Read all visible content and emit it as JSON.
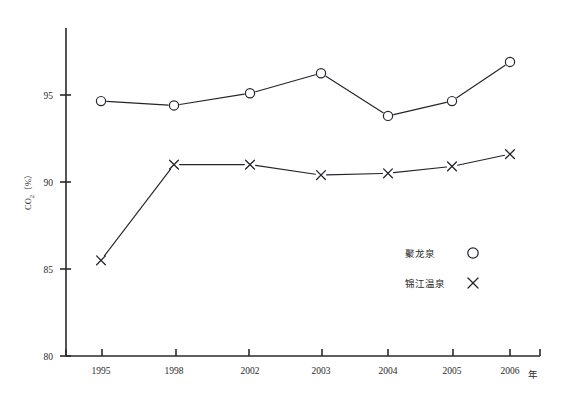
{
  "chart_data": {
    "type": "line",
    "title": "",
    "xlabel": "年",
    "ylabel": "CO₂（%）",
    "ylabel_parts": {
      "base": "CO",
      "sub": "2",
      "unit": "（%）"
    },
    "categories": [
      "1995",
      "1998",
      "2002",
      "2003",
      "2004",
      "2005",
      "2006"
    ],
    "x": [
      1995,
      1998,
      2002,
      2003,
      2004,
      2005,
      2006
    ],
    "ylim": [
      80,
      97.5
    ],
    "yticks": [
      80,
      85,
      90,
      95
    ],
    "ytick_labels": [
      "80",
      "85",
      "90",
      "95"
    ],
    "grid": false,
    "legend_position": "inside-right-lower",
    "series": [
      {
        "name": "聚龙泉",
        "marker": "circle",
        "color": "#24242c",
        "values": [
          94.65,
          94.4,
          95.1,
          96.25,
          93.8,
          94.65,
          96.9
        ]
      },
      {
        "name": "锦江温泉",
        "marker": "x",
        "color": "#24242c",
        "values": [
          85.5,
          91.0,
          91.0,
          90.4,
          90.5,
          90.9,
          91.6
        ]
      }
    ],
    "annotations": []
  },
  "legend": {
    "entries": [
      {
        "label": "聚龙泉",
        "marker": "circle-marker-icon"
      },
      {
        "label": "锦江温泉",
        "marker": "cross-marker-icon"
      }
    ]
  },
  "axes": {
    "x_caption": "年",
    "y_caption": "CO₂（%）"
  }
}
